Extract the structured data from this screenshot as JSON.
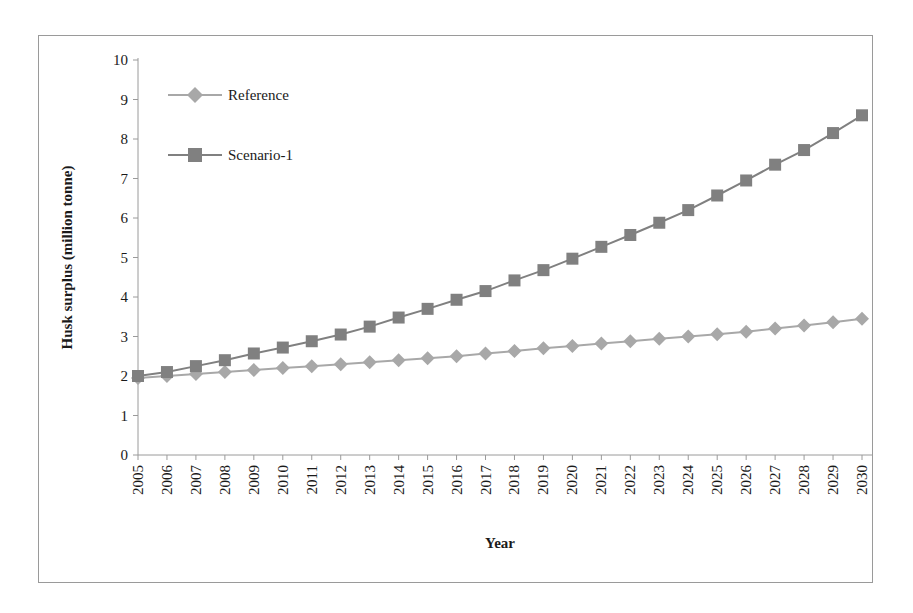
{
  "chart_data": {
    "type": "line",
    "title": "",
    "xlabel": "Year",
    "ylabel": "Husk surplus (million tonne)",
    "ylim": [
      0,
      10
    ],
    "yticks": [
      0,
      1,
      2,
      3,
      4,
      5,
      6,
      7,
      8,
      9,
      10
    ],
    "grid": false,
    "legend_position": "top-left",
    "categories": [
      "2005",
      "2006",
      "2007",
      "2008",
      "2009",
      "2010",
      "2011",
      "2012",
      "2013",
      "2014",
      "2015",
      "2016",
      "2017",
      "2018",
      "2019",
      "2020",
      "2021",
      "2022",
      "2023",
      "2024",
      "2025",
      "2026",
      "2027",
      "2028",
      "2029",
      "2030"
    ],
    "series": [
      {
        "name": "Reference",
        "marker": "diamond",
        "color": "#a8a8a8",
        "values": [
          1.95,
          2.0,
          2.05,
          2.1,
          2.15,
          2.2,
          2.25,
          2.3,
          2.35,
          2.4,
          2.45,
          2.5,
          2.57,
          2.63,
          2.7,
          2.76,
          2.82,
          2.88,
          2.94,
          3.0,
          3.06,
          3.12,
          3.2,
          3.28,
          3.36,
          3.45
        ]
      },
      {
        "name": "Scenario-1",
        "marker": "square",
        "color": "#808080",
        "values": [
          2.0,
          2.1,
          2.25,
          2.4,
          2.57,
          2.72,
          2.88,
          3.05,
          3.25,
          3.48,
          3.7,
          3.93,
          4.15,
          4.42,
          4.68,
          4.97,
          5.27,
          5.57,
          5.88,
          6.2,
          6.57,
          6.95,
          7.35,
          7.72,
          8.15,
          8.6
        ]
      }
    ]
  },
  "legend": {
    "items": [
      {
        "label": "Reference"
      },
      {
        "label": "Scenario-1"
      }
    ]
  },
  "axes": {
    "y_title": "Husk surplus (million tonne)",
    "x_title": "Year"
  },
  "colors": {
    "reference": "#a8a8a8",
    "scenario1": "#808080",
    "axis": "#9a9a9a",
    "text": "#1a1a1a",
    "frame": "#9a9a9a"
  }
}
